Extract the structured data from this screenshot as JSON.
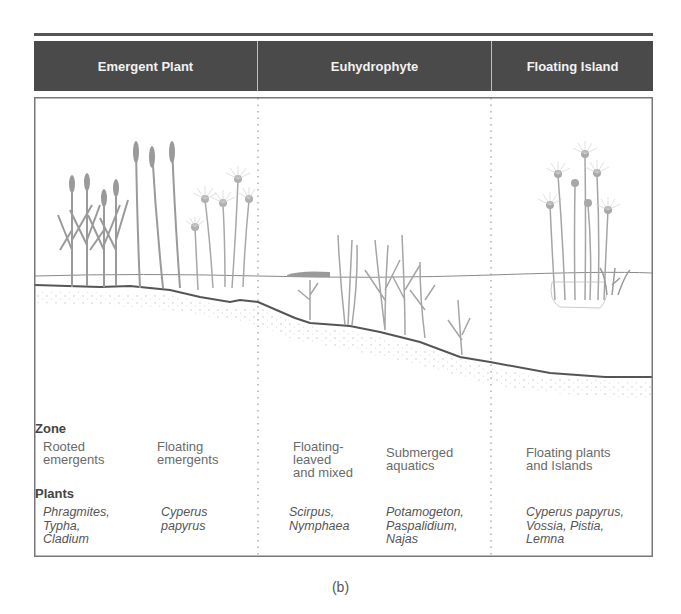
{
  "figure": {
    "caption": "(b)",
    "columns": [
      {
        "id": "emergent",
        "title": "Emergent Plant"
      },
      {
        "id": "euhydrophyte",
        "title": "Euhydrophyte"
      },
      {
        "id": "floating",
        "title": "Floating Island"
      }
    ],
    "zone_label": "Zone",
    "plants_label": "Plants",
    "zones": [
      {
        "name": "Rooted\nemergents",
        "plants": "Phragmites,\nTypha,\nCladium"
      },
      {
        "name": "Floating\nemergents",
        "plants": "Cyperus\npapyrus"
      },
      {
        "name": "Floating-\nleaved\nand mixed",
        "plants": "Scirpus,\nNymphaea"
      },
      {
        "name": "Submerged\naquatics",
        "plants": "Potamogeton,\nPaspalidium,\nNajas"
      },
      {
        "name": "Floating plants\nand Islands",
        "plants": "Cyperus papyrus,\nVossia, Pistia,\nLemna"
      }
    ],
    "colors": {
      "header_bg": "#4a4a4a",
      "header_text": "#f2f2f2",
      "ground_line": "#555555",
      "water_line": "#888888",
      "plant": "#9a9a9a"
    }
  }
}
